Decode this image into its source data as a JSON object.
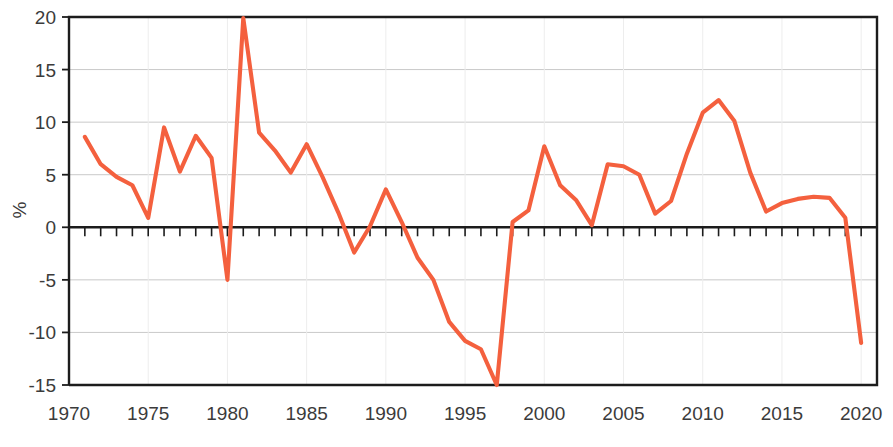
{
  "chart_data": {
    "type": "line",
    "title": "",
    "subtitle": "",
    "xlabel": "",
    "ylabel": "%",
    "xlim": [
      1970,
      2021
    ],
    "ylim": [
      -15,
      20
    ],
    "grid": true,
    "legend": false,
    "legend_position": "none",
    "y_ticks": [
      20,
      15,
      10,
      5,
      0,
      -5,
      -10,
      -15
    ],
    "y_tick_labels": [
      "20",
      "15",
      "10",
      "5",
      "0",
      "-5",
      "-10",
      "-15"
    ],
    "x_ticks": [
      1970,
      1975,
      1980,
      1985,
      1990,
      1995,
      2000,
      2005,
      2010,
      2015,
      2020
    ],
    "x_tick_labels": [
      "1970",
      "1975",
      "1980",
      "1985",
      "1990",
      "1995",
      "2000",
      "2005",
      "2010",
      "2015",
      "2020"
    ],
    "x_minor_tick_step": 1,
    "series": [
      {
        "name": "annual change",
        "color": "#F4603E",
        "x": [
          1971,
          1972,
          1973,
          1974,
          1975,
          1976,
          1977,
          1978,
          1979,
          1980,
          1981,
          1982,
          1983,
          1984,
          1985,
          1986,
          1987,
          1988,
          1989,
          1990,
          1991,
          1992,
          1993,
          1994,
          1995,
          1996,
          1997,
          1998,
          1999,
          2000,
          2001,
          2002,
          2003,
          2004,
          2005,
          2006,
          2007,
          2008,
          2009,
          2010,
          2011,
          2012,
          2013,
          2014,
          2015,
          2016,
          2017,
          2018,
          2019,
          2020
        ],
        "values": [
          8.6,
          6.0,
          4.8,
          4.0,
          3.3,
          0.9,
          9.5,
          5.3,
          8.7,
          6.6,
          3.7,
          -5.0,
          19.9,
          9.0,
          7.3,
          5.2,
          7.9,
          4.8,
          1.4,
          -2.4,
          0.1,
          3.6,
          0.5,
          -2.9,
          -5.0,
          -9.0,
          -10.8,
          -11.6,
          -15.0,
          0.5,
          1.6,
          7.7,
          4.0,
          2.6,
          0.2,
          6.0,
          5.8,
          5.0,
          1.3,
          2.5,
          7.0,
          10.9,
          12.1,
          10.1,
          5.2,
          1.5,
          2.3,
          2.7,
          2.9,
          2.8
        ],
        "note_x_axis_alignment": "first point at 1971, last point at 2020"
      }
    ],
    "series_points_actual": {
      "years": [
        1971,
        1972,
        1973,
        1974,
        1975,
        1976,
        1977,
        1978,
        1979,
        1980,
        1981,
        1982,
        1983,
        1984,
        1985,
        1986,
        1987,
        1988,
        1989,
        1990,
        1991,
        1992,
        1993,
        1994,
        1995,
        1996,
        1997,
        1998,
        1999,
        2000,
        2001,
        2002,
        2003,
        2004,
        2005,
        2006,
        2007,
        2008,
        2009,
        2010,
        2011,
        2012,
        2013,
        2014,
        2015,
        2016,
        2017,
        2018,
        2019,
        2020
      ],
      "percent": [
        8.6,
        6.0,
        4.8,
        4.0,
        0.9,
        9.5,
        5.3,
        8.7,
        6.6,
        -5.0,
        19.9,
        9.0,
        7.3,
        5.2,
        7.9,
        4.8,
        1.4,
        -2.4,
        0.1,
        3.6,
        0.5,
        -2.9,
        -5.0,
        -9.0,
        -10.8,
        -11.6,
        -15.0,
        0.5,
        1.6,
        7.7,
        4.0,
        2.6,
        0.2,
        6.0,
        5.8,
        5.0,
        1.3,
        2.5,
        7.0,
        10.9,
        12.1,
        10.1,
        5.2,
        1.5,
        2.3,
        2.7,
        2.9,
        2.8,
        0.9,
        -11.0
      ]
    }
  },
  "axis": {
    "y_label": "%"
  }
}
